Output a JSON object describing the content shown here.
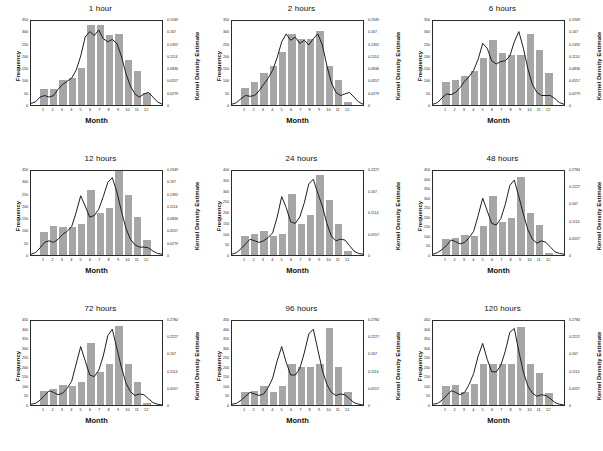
{
  "figure": {
    "rows": 3,
    "cols": 3,
    "background": "#ffffff",
    "bar_color": "#a6a6a6",
    "line_color": "#1a1a1a",
    "axis_color": "#2b2b2b"
  },
  "labels": {
    "xlabel": "Month",
    "ylabel_left": "Frequency",
    "ylabel_right": "Kernel Density Estimate",
    "month_ticks": [
      "1",
      "2",
      "3",
      "4",
      "5",
      "6",
      "7",
      "8",
      "9",
      "10",
      "11",
      "12"
    ]
  },
  "chart_data": [
    {
      "type": "bar",
      "title": "1 hour",
      "xlabel": "Month",
      "ylabel": "Frequency",
      "ylabel_right": "Kernel Density Estimate",
      "categories": [
        "1",
        "2",
        "3",
        "4",
        "5",
        "6",
        "7",
        "8",
        "9",
        "10",
        "11",
        "12"
      ],
      "values": [
        65,
        65,
        100,
        110,
        150,
        325,
        325,
        285,
        290,
        185,
        140,
        50
      ],
      "ylim": [
        0,
        350
      ],
      "yticks": [
        "0",
        "50",
        "100",
        "150",
        "200",
        "250",
        "300",
        "350"
      ],
      "ylim_right": [
        0,
        0.1949
      ],
      "yticks_right": [
        "0",
        "0.0279",
        "0.0557",
        "0.0836",
        "0.1114",
        "0.1392",
        "0.167",
        "0.1949"
      ],
      "kde": [
        0.02,
        0.04,
        0.1,
        0.12,
        0.1,
        0.12,
        0.2,
        0.26,
        0.3,
        0.34,
        0.44,
        0.62,
        0.86,
        0.93,
        0.88,
        0.95,
        0.84,
        0.8,
        0.83,
        0.78,
        0.62,
        0.4,
        0.24,
        0.14,
        0.1,
        0.14,
        0.16,
        0.1,
        0.04,
        0.01
      ],
      "grid": false,
      "legend": "none"
    },
    {
      "type": "bar",
      "title": "2 hours",
      "xlabel": "Month",
      "ylabel": "Frequency",
      "ylabel_right": "Kernel Density Estimate",
      "categories": [
        "1",
        "2",
        "3",
        "4",
        "5",
        "6",
        "7",
        "8",
        "9",
        "10",
        "11",
        "12"
      ],
      "values": [
        70,
        95,
        130,
        160,
        215,
        290,
        270,
        270,
        300,
        160,
        100,
        12
      ],
      "ylim": [
        0,
        350
      ],
      "yticks": [
        "0",
        "50",
        "100",
        "150",
        "200",
        "250",
        "300",
        "350"
      ],
      "ylim_right": [
        0,
        0.1949
      ],
      "yticks_right": [
        "0",
        "0.0279",
        "0.0557",
        "0.0836",
        "0.1114",
        "0.1392",
        "0.167",
        "0.1949"
      ],
      "kde": [
        0.01,
        0.03,
        0.08,
        0.12,
        0.11,
        0.12,
        0.18,
        0.26,
        0.34,
        0.44,
        0.6,
        0.8,
        0.9,
        0.82,
        0.86,
        0.78,
        0.82,
        0.76,
        0.84,
        0.9,
        0.76,
        0.5,
        0.28,
        0.16,
        0.12,
        0.14,
        0.16,
        0.1,
        0.04,
        0.01
      ],
      "grid": false,
      "legend": "none"
    },
    {
      "type": "bar",
      "title": "6 hours",
      "xlabel": "Month",
      "ylabel": "Frequency",
      "ylabel_right": "Kernel Density Estimate",
      "categories": [
        "1",
        "2",
        "3",
        "4",
        "5",
        "6",
        "7",
        "8",
        "9",
        "10",
        "11",
        "12"
      ],
      "values": [
        95,
        100,
        120,
        140,
        190,
        265,
        210,
        205,
        205,
        290,
        225,
        130
      ],
      "ylim": [
        0,
        350
      ],
      "yticks": [
        "0",
        "50",
        "100",
        "150",
        "200",
        "250",
        "300",
        "350"
      ],
      "ylim_right": [
        0,
        0.1949
      ],
      "yticks_right": [
        "0",
        "0.0279",
        "0.0557",
        "0.0836",
        "0.1114",
        "0.1392",
        "0.167",
        "0.1949"
      ],
      "kde": [
        0.01,
        0.03,
        0.09,
        0.14,
        0.13,
        0.16,
        0.22,
        0.3,
        0.36,
        0.44,
        0.58,
        0.78,
        0.72,
        0.56,
        0.52,
        0.55,
        0.56,
        0.62,
        0.8,
        0.93,
        0.72,
        0.46,
        0.26,
        0.16,
        0.12,
        0.12,
        0.12,
        0.08,
        0.03,
        0.01
      ],
      "grid": false,
      "legend": "none"
    },
    {
      "type": "bar",
      "title": "12 hours",
      "xlabel": "Month",
      "ylabel": "Frequency",
      "ylabel_right": "Kernel Density Estimate",
      "categories": [
        "1",
        "2",
        "3",
        "4",
        "5",
        "6",
        "7",
        "8",
        "9",
        "10",
        "11",
        "12"
      ],
      "values": [
        95,
        120,
        115,
        115,
        125,
        265,
        170,
        190,
        340,
        245,
        155,
        60
      ],
      "ylim": [
        0,
        350
      ],
      "yticks": [
        "0",
        "50",
        "100",
        "150",
        "200",
        "250",
        "300",
        "350"
      ],
      "ylim_right": [
        0,
        0.1949
      ],
      "yticks_right": [
        "0",
        "0.0279",
        "0.0557",
        "0.0836",
        "0.1114",
        "0.1392",
        "0.167",
        "0.1949"
      ],
      "kde": [
        0.01,
        0.03,
        0.09,
        0.16,
        0.18,
        0.16,
        0.2,
        0.26,
        0.3,
        0.36,
        0.54,
        0.75,
        0.62,
        0.48,
        0.5,
        0.58,
        0.74,
        0.92,
        0.98,
        0.8,
        0.56,
        0.34,
        0.2,
        0.13,
        0.1,
        0.1,
        0.09,
        0.05,
        0.02,
        0.01
      ],
      "grid": false,
      "legend": "none"
    },
    {
      "type": "bar",
      "title": "24 hours",
      "xlabel": "Month",
      "ylabel": "Frequency",
      "ylabel_right": "Kernel Density Estimate",
      "categories": [
        "1",
        "2",
        "3",
        "4",
        "5",
        "6",
        "7",
        "8",
        "9",
        "10",
        "11",
        "12"
      ],
      "values": [
        88,
        100,
        110,
        90,
        100,
        285,
        145,
        185,
        370,
        255,
        145,
        18
      ],
      "ylim": [
        0,
        400
      ],
      "yticks": [
        "0",
        "50",
        "100",
        "150",
        "200",
        "250",
        "300",
        "350",
        "400"
      ],
      "ylim_right": [
        0,
        0.2227
      ],
      "yticks_right": [
        "0",
        "0.0557",
        "0.1114",
        "0.167",
        "0.2227"
      ],
      "kde": [
        0.01,
        0.03,
        0.08,
        0.14,
        0.2,
        0.18,
        0.16,
        0.18,
        0.22,
        0.28,
        0.48,
        0.74,
        0.6,
        0.42,
        0.4,
        0.48,
        0.66,
        0.9,
        0.96,
        0.78,
        0.62,
        0.4,
        0.24,
        0.18,
        0.2,
        0.19,
        0.12,
        0.05,
        0.02,
        0.01
      ],
      "grid": false,
      "legend": "none"
    },
    {
      "type": "bar",
      "title": "48 hours",
      "xlabel": "Month",
      "ylabel": "Frequency",
      "ylabel_right": "Kernel Density Estimate",
      "categories": [
        "1",
        "2",
        "3",
        "4",
        "5",
        "6",
        "7",
        "8",
        "9",
        "10",
        "11",
        "12"
      ],
      "values": [
        85,
        90,
        105,
        100,
        150,
        310,
        175,
        195,
        410,
        220,
        155,
        12
      ],
      "ylim": [
        0,
        450
      ],
      "yticks": [
        "0",
        "50",
        "100",
        "150",
        "200",
        "250",
        "300",
        "350",
        "400",
        "450"
      ],
      "ylim_right": [
        0,
        0.2784
      ],
      "yticks_right": [
        "0",
        "0.0557",
        "0.1114",
        "0.167",
        "0.2227",
        "0.2784"
      ],
      "kde": [
        0.01,
        0.03,
        0.07,
        0.12,
        0.19,
        0.17,
        0.14,
        0.16,
        0.22,
        0.3,
        0.5,
        0.72,
        0.56,
        0.4,
        0.38,
        0.46,
        0.64,
        0.88,
        0.95,
        0.74,
        0.52,
        0.32,
        0.2,
        0.15,
        0.18,
        0.16,
        0.1,
        0.04,
        0.02,
        0.01
      ],
      "grid": false,
      "legend": "none"
    },
    {
      "type": "bar",
      "title": "72 hours",
      "xlabel": "Month",
      "ylabel": "Frequency",
      "ylabel_right": "Kernel Density Estimate",
      "categories": [
        "1",
        "2",
        "3",
        "4",
        "5",
        "6",
        "7",
        "8",
        "9",
        "10",
        "11",
        "12"
      ],
      "values": [
        75,
        85,
        105,
        100,
        120,
        325,
        175,
        215,
        415,
        215,
        120,
        10
      ],
      "ylim": [
        0,
        450
      ],
      "yticks": [
        "0",
        "50",
        "100",
        "150",
        "200",
        "250",
        "300",
        "350",
        "400",
        "450"
      ],
      "ylim_right": [
        0,
        0.2784
      ],
      "yticks_right": [
        "0",
        "0.0557",
        "0.1114",
        "0.167",
        "0.2227",
        "0.2784"
      ],
      "kde": [
        0.01,
        0.02,
        0.06,
        0.12,
        0.18,
        0.16,
        0.13,
        0.15,
        0.21,
        0.3,
        0.52,
        0.74,
        0.56,
        0.38,
        0.36,
        0.44,
        0.62,
        0.88,
        0.96,
        0.72,
        0.48,
        0.28,
        0.17,
        0.12,
        0.14,
        0.13,
        0.08,
        0.03,
        0.01,
        0.0
      ],
      "grid": false,
      "legend": "none"
    },
    {
      "type": "bar",
      "title": "96 hours",
      "xlabel": "Month",
      "ylabel": "Frequency",
      "ylabel_right": "Kernel Density Estimate",
      "categories": [
        "1",
        "2",
        "3",
        "4",
        "5",
        "6",
        "7",
        "8",
        "9",
        "10",
        "11",
        "12"
      ],
      "values": [
        70,
        75,
        100,
        70,
        100,
        215,
        200,
        200,
        215,
        405,
        200,
        70
      ],
      "ylim": [
        0,
        450
      ],
      "yticks": [
        "0",
        "50",
        "100",
        "150",
        "200",
        "250",
        "300",
        "350",
        "400",
        "450"
      ],
      "ylim_right": [
        0,
        0.2784
      ],
      "yticks_right": [
        "0",
        "0.0557",
        "0.1114",
        "0.167",
        "0.2227",
        "0.2784"
      ],
      "kde": [
        0.01,
        0.02,
        0.06,
        0.11,
        0.16,
        0.14,
        0.12,
        0.14,
        0.22,
        0.34,
        0.56,
        0.74,
        0.54,
        0.38,
        0.38,
        0.46,
        0.66,
        0.9,
        0.96,
        0.7,
        0.44,
        0.26,
        0.16,
        0.12,
        0.14,
        0.13,
        0.08,
        0.03,
        0.01,
        0.0
      ],
      "grid": false,
      "legend": "none"
    },
    {
      "type": "bar",
      "title": "120 hours",
      "xlabel": "Month",
      "ylabel": "Frequency",
      "ylabel_right": "Kernel Density Estimate",
      "categories": [
        "1",
        "2",
        "3",
        "4",
        "5",
        "6",
        "7",
        "8",
        "9",
        "10",
        "11",
        "12"
      ],
      "values": [
        100,
        105,
        70,
        110,
        215,
        215,
        215,
        215,
        410,
        215,
        170,
        65
      ],
      "ylim": [
        0,
        450
      ],
      "yticks": [
        "0",
        "50",
        "100",
        "150",
        "200",
        "250",
        "300",
        "350",
        "400",
        "450"
      ],
      "ylim_right": [
        0,
        0.2784
      ],
      "yticks_right": [
        "0",
        "0.0557",
        "0.1114",
        "0.167",
        "0.2227",
        "0.2784"
      ],
      "kde": [
        0.01,
        0.02,
        0.06,
        0.12,
        0.18,
        0.16,
        0.13,
        0.16,
        0.26,
        0.4,
        0.62,
        0.78,
        0.58,
        0.42,
        0.42,
        0.5,
        0.68,
        0.92,
        0.97,
        0.68,
        0.42,
        0.24,
        0.15,
        0.11,
        0.13,
        0.12,
        0.08,
        0.03,
        0.01,
        0.0
      ]
    }
  ]
}
